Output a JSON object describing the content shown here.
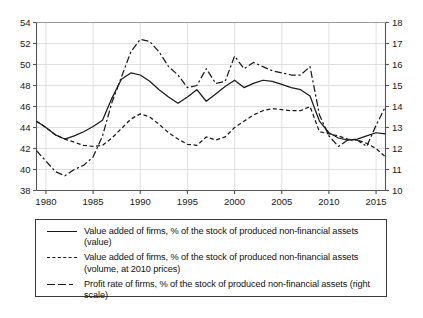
{
  "chart_data": {
    "type": "line",
    "title": "",
    "xlabel": "",
    "ylabel": "",
    "y2label": "",
    "grid": true,
    "legend_position": "bottom",
    "xlim": [
      1979,
      2016
    ],
    "ylim": [
      38,
      54
    ],
    "y2lim": [
      10,
      18
    ],
    "xticks": [
      1980,
      1985,
      1990,
      1995,
      2000,
      2005,
      2010,
      2015
    ],
    "yticks": [
      38,
      40,
      42,
      44,
      46,
      48,
      50,
      52,
      54
    ],
    "y2ticks": [
      10,
      11,
      12,
      13,
      14,
      15,
      16,
      17,
      18
    ],
    "x": [
      1979,
      1980,
      1981,
      1982,
      1983,
      1984,
      1985,
      1986,
      1987,
      1988,
      1989,
      1990,
      1991,
      1992,
      1993,
      1994,
      1995,
      1996,
      1997,
      1998,
      1999,
      2000,
      2001,
      2002,
      2003,
      2004,
      2005,
      2006,
      2007,
      2008,
      2009,
      2010,
      2011,
      2012,
      2013,
      2014,
      2015,
      2016
    ],
    "series": [
      {
        "name": "Value added of firms, % of the stock of produced non-financial assets (value)",
        "axis": "left",
        "style": "solid",
        "color": "#1a1a1a",
        "values": [
          44.6,
          44.0,
          43.3,
          42.9,
          43.2,
          43.6,
          44.1,
          44.7,
          46.8,
          48.6,
          49.2,
          49.0,
          48.4,
          47.6,
          46.9,
          46.3,
          46.9,
          47.6,
          46.5,
          47.2,
          47.9,
          48.5,
          47.8,
          48.2,
          48.5,
          48.4,
          48.1,
          47.8,
          47.6,
          47.0,
          44.6,
          43.5,
          43.0,
          42.8,
          42.9,
          43.2,
          43.5,
          43.4
        ]
      },
      {
        "name": "Value added of firms, % of the stock of produced non-financial assets (volume, at 2010 prices)",
        "axis": "left",
        "style": "dashed",
        "color": "#1a1a1a",
        "values": [
          44.6,
          44.0,
          43.3,
          42.9,
          42.6,
          42.3,
          42.2,
          42.3,
          43.0,
          43.9,
          44.8,
          45.3,
          45.0,
          44.3,
          43.5,
          42.9,
          42.4,
          42.3,
          43.1,
          42.8,
          43.1,
          44.0,
          44.6,
          45.2,
          45.6,
          45.8,
          45.7,
          45.6,
          45.6,
          46.0,
          43.6,
          43.4,
          43.2,
          42.9,
          42.8,
          42.5,
          42.0,
          41.2
        ]
      },
      {
        "name": "Profit rate of firms, % of the stock of produced non-financial assets (right scale)",
        "axis": "right",
        "style": "dashdot",
        "color": "#1a1a1a",
        "values": [
          11.9,
          11.4,
          10.9,
          10.7,
          11.0,
          11.2,
          11.6,
          12.6,
          14.2,
          15.4,
          16.6,
          17.2,
          17.1,
          16.6,
          15.9,
          15.5,
          14.9,
          15.0,
          15.8,
          15.1,
          15.2,
          16.4,
          15.8,
          16.1,
          15.9,
          15.7,
          15.6,
          15.5,
          15.5,
          15.9,
          13.6,
          12.6,
          12.1,
          12.4,
          12.4,
          12.1,
          13.1,
          14.0
        ]
      }
    ]
  },
  "legend": {
    "items": [
      {
        "style": "solid",
        "label": "Value added of firms, % of the stock of produced non-financial assets (value)"
      },
      {
        "style": "dashed",
        "label": "Value added of firms, % of the stock of produced non-financial assets (volume, at 2010 prices)"
      },
      {
        "style": "dashdot",
        "label": "Profit rate of firms, % of the stock of produced non-financial assets (right scale)"
      }
    ]
  },
  "colors": {
    "line": "#1a1a1a",
    "axis": "#555555",
    "grid": "#d8d8dc",
    "background": "#ffffff"
  }
}
